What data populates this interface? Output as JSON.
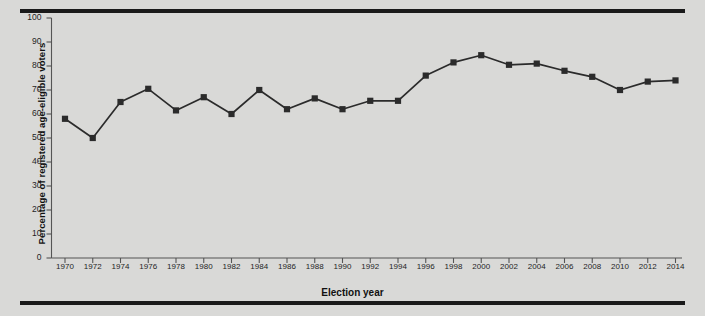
{
  "figure": {
    "background_color": "#d9d9d7",
    "rule_color": "#1a1a1a",
    "marker_color": "#2b2b2b",
    "line_color": "#2b2b2b",
    "axis_color": "#555555"
  },
  "chart_data": {
    "type": "line",
    "title": "",
    "xlabel": "Election year",
    "ylabel": "Percentage of registered age-eligible voters",
    "xlim": [
      1969,
      2015
    ],
    "ylim": [
      0,
      100
    ],
    "grid": false,
    "legend": null,
    "ytick_labels": [
      "0",
      "10",
      "20",
      "30",
      "40",
      "50",
      "60",
      "70",
      "80",
      "90",
      "100"
    ],
    "ytick_values": [
      0,
      10,
      20,
      30,
      40,
      50,
      60,
      70,
      80,
      90,
      100
    ],
    "categories": [
      "1970",
      "1972",
      "1974",
      "1976",
      "1978",
      "1980",
      "1982",
      "1984",
      "1986",
      "1988",
      "1990",
      "1992",
      "1994",
      "1996",
      "1998",
      "2000",
      "2002",
      "2004",
      "2006",
      "2008",
      "2010",
      "2012",
      "2014"
    ],
    "x": [
      1970,
      1972,
      1974,
      1976,
      1978,
      1980,
      1982,
      1984,
      1986,
      1988,
      1990,
      1992,
      1994,
      1996,
      1998,
      2000,
      2002,
      2004,
      2006,
      2008,
      2010,
      2012,
      2014
    ],
    "values": [
      58,
      50,
      65,
      70.5,
      61.5,
      67,
      60,
      70,
      62,
      66.5,
      62,
      65.5,
      65.5,
      76,
      81.5,
      84.5,
      80.5,
      81,
      78,
      75.5,
      70,
      73.5,
      74
    ],
    "series": [
      {
        "name": "Percentage of registered age-eligible voters",
        "values": [
          58,
          50,
          65,
          70.5,
          61.5,
          67,
          60,
          70,
          62,
          66.5,
          62,
          65.5,
          65.5,
          76,
          81.5,
          84.5,
          80.5,
          81,
          78,
          75.5,
          70,
          73.5,
          74
        ]
      }
    ]
  }
}
